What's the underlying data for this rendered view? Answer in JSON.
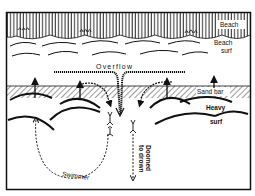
{
  "diagram": {
    "type": "rip-current illustration",
    "labels": {
      "beach": "Beach",
      "beach_surf_1": "Beach",
      "beach_surf_2": "surf",
      "overflow": "Overflow",
      "sand_bar": "Sand bar",
      "heavy_surf_1": "Heavy",
      "heavy_surf_2": "surf",
      "swimmer": "Swimmer",
      "doomed_1": "Doomed",
      "doomed_2": "to drown"
    },
    "colors": {
      "ink": "#111111",
      "background": "#ffffff"
    }
  }
}
